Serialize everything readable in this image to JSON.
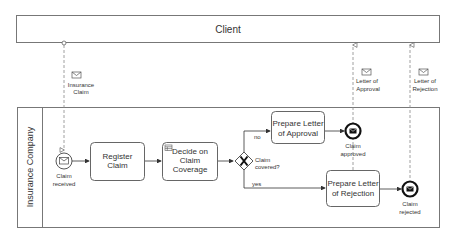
{
  "diagram": {
    "type": "BPMN collaboration",
    "pools": {
      "client": {
        "label": "Client"
      },
      "insurance": {
        "label": "Insurance Company"
      }
    },
    "events": {
      "start": {
        "label_line1": "Claim",
        "label_line2": "received",
        "kind": "message-start-event"
      },
      "end_approved": {
        "label_line1": "Claim",
        "label_line2": "approved",
        "kind": "message-end-event"
      },
      "end_rejected": {
        "label_line1": "Claim",
        "label_line2": "rejected",
        "kind": "message-end-event"
      }
    },
    "tasks": {
      "register": {
        "line1": "Register",
        "line2": "Claim"
      },
      "decide": {
        "line1": "Decide on",
        "line2": "Claim",
        "line3": "Coverage",
        "marker": "business-rule-table-icon"
      },
      "approval": {
        "line1": "Prepare Letter",
        "line2": "of Approval"
      },
      "rejection": {
        "line1": "Prepare Letter",
        "line2": "of Rejection"
      }
    },
    "gateway": {
      "label_line1": "Claim",
      "label_line2": "covered?",
      "kind": "exclusive-gateway"
    },
    "flows": {
      "no": "no",
      "yes": "yes"
    },
    "messages": {
      "insurance_claim": {
        "line1": "Insurance",
        "line2": "Claim"
      },
      "letter_approval": {
        "line1": "Letter of",
        "line2": "Approval"
      },
      "letter_rejection": {
        "line1": "Letter of",
        "line2": "Rejection"
      }
    }
  }
}
